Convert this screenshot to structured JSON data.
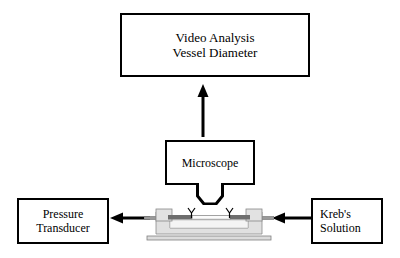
{
  "diagram": {
    "title_block": {
      "name": "video-analysis",
      "lines": [
        "Video Analysis",
        "Vessel Diameter"
      ]
    },
    "microscope_block": {
      "name": "microscope",
      "lines": [
        "Microscope"
      ]
    },
    "pressure_block": {
      "name": "pressure-transducer",
      "lines": [
        "Pressure",
        "Transducer"
      ]
    },
    "krebs_block": {
      "name": "krebs-solution",
      "lines": [
        "Kreb's",
        "Solution"
      ]
    },
    "arrows": [
      {
        "name": "arrow-microscope-to-video",
        "from": "Microscope",
        "to": "Video Analysis",
        "direction": "up"
      },
      {
        "name": "arrow-chamber-to-transducer",
        "from": "Vessel Chamber",
        "to": "Pressure Transducer",
        "direction": "left"
      },
      {
        "name": "arrow-krebs-to-chamber",
        "from": "Kreb's Solution",
        "to": "Vessel Chamber",
        "direction": "left"
      }
    ],
    "apparatus": {
      "name": "vessel-chamber",
      "parts": [
        "base-plate",
        "chamber-body",
        "left-cannula-block",
        "right-cannula-block",
        "left-inlet-tube",
        "right-inlet-tube",
        "vessel-segment",
        "left-cannula-tip",
        "right-cannula-tip"
      ]
    },
    "colors": {
      "stroke": "#000000",
      "background": "#ffffff",
      "chamber_light": "#e8e8e8",
      "chamber_mid": "#c9c9c9",
      "chamber_dark": "#6e6e6e",
      "tube_gray": "#9a9a9a"
    }
  }
}
